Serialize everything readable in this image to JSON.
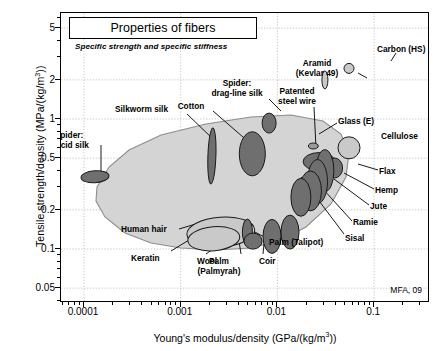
{
  "chart_data": {
    "type": "scatter",
    "title": "Properties of fibers",
    "subtitle": "Specific strength and specific stiffness",
    "credit": "MFA, 09",
    "xlabel": "Young's modulus/density (GPa/(kg/m3))",
    "ylabel": "Tensile strength/density (MPa/(kg/m3))",
    "xscale": "log",
    "yscale": "log",
    "xlim": [
      7e-05,
      0.2
    ],
    "ylim": [
      0.04,
      6.5
    ],
    "xticks": [
      "0.0001",
      "0.001",
      "0.01",
      "0.1"
    ],
    "xtick_values": [
      0.0001,
      0.001,
      0.01,
      0.1
    ],
    "yticks": [
      "5",
      "2",
      "1",
      "0.5",
      "0.2",
      "0.1",
      "0.05"
    ],
    "ytick_values": [
      5,
      2,
      1,
      0.5,
      0.2,
      0.1,
      0.05
    ],
    "grid": true,
    "legend": "none",
    "envelope_label": "natural and man-made fibers envelope",
    "points": [
      {
        "label": "Spider:\nviscid silk",
        "x": 0.00013,
        "y": 0.36,
        "rx_px": 14,
        "ry_px": 6,
        "rot": -4,
        "fill": "dark",
        "lx": 68,
        "ly": 130,
        "align": "c",
        "leader": [
          [
            100,
            144
          ],
          [
            100,
            172
          ]
        ]
      },
      {
        "label": "Silkworm silk",
        "x": 0.0021,
        "y": 0.52,
        "rx_px": 4,
        "ry_px": 28,
        "rot": 2,
        "fill": "dark",
        "lx": 114,
        "ly": 104,
        "align": "l",
        "leader": [
          [
            186,
            113
          ],
          [
            212,
            138
          ]
        ]
      },
      {
        "label": "Cotton",
        "x": 0.0055,
        "y": 0.54,
        "rx_px": 13,
        "ry_px": 22,
        "rot": 0,
        "fill": "dark",
        "lx": 190,
        "ly": 101,
        "align": "c",
        "leader": [
          [
            212,
            110
          ],
          [
            250,
            143
          ]
        ]
      },
      {
        "label": "Spider:\ndrag-line silk",
        "x": 0.0082,
        "y": 0.93,
        "rx_px": 7,
        "ry_px": 10,
        "rot": 0,
        "fill": "dark",
        "lx": 236,
        "ly": 78,
        "align": "c",
        "leader": [
          [
            268,
            98
          ],
          [
            280,
            110
          ]
        ]
      },
      {
        "label": "Patented\nsteel wire",
        "x": 0.027,
        "y": 0.47,
        "rx_px": 16,
        "ry_px": 9,
        "rot": 0,
        "fill": "dark",
        "lx": 296,
        "ly": 86,
        "align": "c",
        "leader": [
          [
            313,
            106
          ],
          [
            315,
            147
          ]
        ]
      },
      {
        "label": "Glass (E)",
        "x": 0.0235,
        "y": 0.62,
        "rx_px": 5,
        "ry_px": 3,
        "rot": 0,
        "fill": "mid",
        "lx": 337,
        "ly": 116,
        "align": "l",
        "leader": [
          [
            336,
            122
          ],
          [
            318,
            133
          ]
        ]
      },
      {
        "label": "Cellulose",
        "x": 0.055,
        "y": 0.6,
        "rx_px": 11,
        "ry_px": 11,
        "rot": 0,
        "fill": "light",
        "lx": 380,
        "ly": 131,
        "align": "l",
        "leader": null
      },
      {
        "label": "Aramid\n(Kevlar 49)",
        "x": 0.031,
        "y": 2.0,
        "rx_px": 3,
        "ry_px": 9,
        "rot": 0,
        "fill": "light",
        "lx": 316,
        "ly": 58,
        "align": "c",
        "leader": [
          [
            357,
            72
          ],
          [
            366,
            77
          ]
        ]
      },
      {
        "label": "Carbon (HS)",
        "x": 0.055,
        "y": 2.45,
        "rx_px": 5,
        "ry_px": 5,
        "rot": 0,
        "fill": "light",
        "lx": 376,
        "ly": 44,
        "align": "l",
        "leader": [
          [
            395,
            52
          ],
          [
            390,
            60
          ]
        ]
      },
      {
        "label": "Flax",
        "x": 0.039,
        "y": 0.42,
        "rx_px": 8,
        "ry_px": 10,
        "rot": 0,
        "fill": "dark",
        "lx": 378,
        "ly": 166,
        "align": "l",
        "leader": [
          [
            377,
            169
          ],
          [
            357,
            163
          ]
        ]
      },
      {
        "label": "Hemp",
        "x": 0.031,
        "y": 0.4,
        "rx_px": 9,
        "ry_px": 21,
        "rot": 0,
        "fill": "dark",
        "lx": 374,
        "ly": 185,
        "align": "l",
        "leader": [
          [
            373,
            188
          ],
          [
            343,
            172
          ]
        ]
      },
      {
        "label": "Jute",
        "x": 0.026,
        "y": 0.33,
        "rx_px": 10,
        "ry_px": 22,
        "rot": 0,
        "fill": "dark",
        "lx": 369,
        "ly": 201,
        "align": "l",
        "leader": [
          [
            368,
            204
          ],
          [
            333,
            178
          ]
        ]
      },
      {
        "label": "Ramie",
        "x": 0.022,
        "y": 0.28,
        "rx_px": 11,
        "ry_px": 20,
        "rot": 0,
        "fill": "dark",
        "lx": 352,
        "ly": 217,
        "align": "l",
        "leader": [
          [
            351,
            220
          ],
          [
            322,
            188
          ]
        ]
      },
      {
        "label": "Sisal",
        "x": 0.0175,
        "y": 0.25,
        "rx_px": 10,
        "ry_px": 19,
        "rot": 0,
        "fill": "dark",
        "lx": 344,
        "ly": 233,
        "align": "l",
        "leader": [
          [
            343,
            233
          ],
          [
            300,
            176
          ]
        ]
      },
      {
        "label": "Human hair",
        "x": 0.0026,
        "y": 0.135,
        "rx_px": 34,
        "ry_px": 15,
        "rot": -4,
        "fill": "light",
        "lx": 120,
        "ly": 224,
        "align": "l",
        "leader": [
          [
            178,
            228
          ],
          [
            208,
            219
          ]
        ]
      },
      {
        "label": "Keratin",
        "x": 0.0022,
        "y": 0.12,
        "rx_px": 26,
        "ry_px": 12,
        "rot": -5,
        "fill": "light",
        "lx": 130,
        "ly": 253,
        "align": "l",
        "leader": [
          [
            170,
            250
          ],
          [
            188,
            239
          ]
        ]
      },
      {
        "label": "Wool",
        "x": 0.0049,
        "y": 0.135,
        "rx_px": 5,
        "ry_px": 13,
        "rot": 0,
        "fill": "dark",
        "lx": 196,
        "ly": 256,
        "align": "l",
        "leader": [
          [
            205,
            253
          ],
          [
            233,
            233
          ]
        ]
      },
      {
        "label": "Palm\n(Palmyrah)",
        "x": 0.0056,
        "y": 0.115,
        "rx_px": 9,
        "ry_px": 8,
        "rot": 0,
        "fill": "dark",
        "lx": 218,
        "ly": 256,
        "align": "c",
        "leader": [
          [
            240,
            253
          ],
          [
            238,
            240
          ]
        ]
      },
      {
        "label": "Coir",
        "x": 0.0088,
        "y": 0.125,
        "rx_px": 9,
        "ry_px": 17,
        "rot": 0,
        "fill": "dark",
        "lx": 258,
        "ly": 256,
        "align": "l",
        "leader": [
          [
            262,
            253
          ],
          [
            263,
            243
          ]
        ]
      },
      {
        "label": "Palm (Talipot)",
        "x": 0.0135,
        "y": 0.135,
        "rx_px": 9,
        "ry_px": 17,
        "rot": 0,
        "fill": "dark",
        "lx": 268,
        "ly": 237,
        "align": "l",
        "leader": [
          [
            267,
            238
          ],
          [
            252,
            230
          ]
        ]
      }
    ]
  },
  "axes": {
    "y_title": "Tensile strength/density (MPa/(kg/m",
    "y_title_sup": "3",
    "y_title_end": "))",
    "x_title": "Young's modulus/density (GPa/(kg/m",
    "x_title_sup": "3",
    "x_title_end": "))"
  }
}
